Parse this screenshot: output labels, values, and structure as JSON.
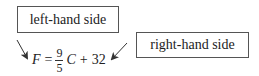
{
  "labels": {
    "left": "left-hand side",
    "right": "right-hand side"
  },
  "equation": {
    "lhs_var": "F",
    "equals": "=",
    "frac_num": "9",
    "frac_den": "5",
    "rhs_var": "C",
    "plus": "+",
    "constant": "32"
  },
  "colors": {
    "box_border": "#555555",
    "arrow": "#333333",
    "text": "#222222"
  }
}
